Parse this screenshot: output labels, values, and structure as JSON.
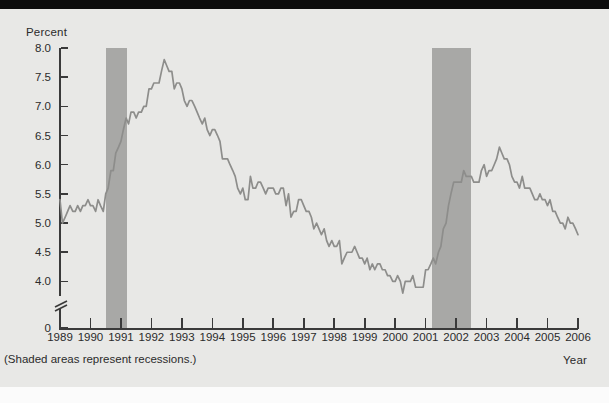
{
  "figure": {
    "background_color": "#e8e8e6",
    "caption": "(Shaded areas represent recessions.)",
    "ylabel": "Percent",
    "xlabel": "Year",
    "line_color": "#8d8d8b",
    "band_color": "#a8a8a6",
    "axis_color": "#3a3a3a"
  },
  "chart_data": {
    "type": "line",
    "title": "",
    "subtitle": "",
    "xlabel": "Year",
    "ylabel": "Percent",
    "annotations": [
      "(Shaded areas represent recessions.)"
    ],
    "grid": false,
    "legend": null,
    "xlim": [
      1989,
      2006
    ],
    "ylim": [
      3.75,
      8.0
    ],
    "y_axis_break": true,
    "y_axis_zero_shown": true,
    "xticks": [
      1989,
      1990,
      1991,
      1992,
      1993,
      1994,
      1995,
      1996,
      1997,
      1998,
      1999,
      2000,
      2001,
      2002,
      2003,
      2004,
      2005,
      2006
    ],
    "xtick_labels": [
      "1989",
      "1990",
      "1991",
      "1992",
      "1993",
      "1994",
      "1995",
      "1996",
      "1997",
      "1998",
      "1999",
      "2000",
      "2001",
      "2002",
      "2003",
      "2004",
      "2005",
      "2006"
    ],
    "yticks": [
      0,
      4.0,
      4.5,
      5.0,
      5.5,
      6.0,
      6.5,
      7.0,
      7.5,
      8.0
    ],
    "ytick_labels": [
      "0",
      "4.0",
      "4.5",
      "5.0",
      "5.5",
      "6.0",
      "6.5",
      "7.0",
      "7.5",
      "8.0"
    ],
    "shaded_regions": [
      {
        "label": "recession",
        "x0": 1990.5,
        "x1": 1991.2
      },
      {
        "label": "recession",
        "x0": 2001.2,
        "x1": 2002.5
      }
    ],
    "series": [
      {
        "name": "Unemployment rate",
        "x": [
          1989.0,
          1989.08,
          1989.17,
          1989.25,
          1989.33,
          1989.42,
          1989.5,
          1989.58,
          1989.67,
          1989.75,
          1989.83,
          1989.92,
          1990.0,
          1990.08,
          1990.17,
          1990.25,
          1990.33,
          1990.42,
          1990.5,
          1990.58,
          1990.67,
          1990.75,
          1990.83,
          1990.92,
          1991.0,
          1991.08,
          1991.17,
          1991.25,
          1991.33,
          1991.42,
          1991.5,
          1991.58,
          1991.67,
          1991.75,
          1991.83,
          1991.92,
          1992.0,
          1992.08,
          1992.17,
          1992.25,
          1992.33,
          1992.42,
          1992.5,
          1992.58,
          1992.67,
          1992.75,
          1992.83,
          1992.92,
          1993.0,
          1993.08,
          1993.17,
          1993.25,
          1993.33,
          1993.42,
          1993.5,
          1993.58,
          1993.67,
          1993.75,
          1993.83,
          1993.92,
          1994.0,
          1994.08,
          1994.17,
          1994.25,
          1994.33,
          1994.42,
          1994.5,
          1994.58,
          1994.67,
          1994.75,
          1994.83,
          1994.92,
          1995.0,
          1995.08,
          1995.17,
          1995.25,
          1995.33,
          1995.42,
          1995.5,
          1995.58,
          1995.67,
          1995.75,
          1995.83,
          1995.92,
          1996.0,
          1996.08,
          1996.17,
          1996.25,
          1996.33,
          1996.42,
          1996.5,
          1996.58,
          1996.67,
          1996.75,
          1996.83,
          1996.92,
          1997.0,
          1997.08,
          1997.17,
          1997.25,
          1997.33,
          1997.42,
          1997.5,
          1997.58,
          1997.67,
          1997.75,
          1997.83,
          1997.92,
          1998.0,
          1998.08,
          1998.17,
          1998.25,
          1998.33,
          1998.42,
          1998.5,
          1998.58,
          1998.67,
          1998.75,
          1998.83,
          1998.92,
          1999.0,
          1999.08,
          1999.17,
          1999.25,
          1999.33,
          1999.42,
          1999.5,
          1999.58,
          1999.67,
          1999.75,
          1999.83,
          1999.92,
          2000.0,
          2000.08,
          2000.17,
          2000.25,
          2000.33,
          2000.42,
          2000.5,
          2000.58,
          2000.67,
          2000.75,
          2000.83,
          2000.92,
          2001.0,
          2001.08,
          2001.17,
          2001.25,
          2001.33,
          2001.42,
          2001.5,
          2001.58,
          2001.67,
          2001.75,
          2001.83,
          2001.92,
          2002.0,
          2002.08,
          2002.17,
          2002.25,
          2002.33,
          2002.42,
          2002.5,
          2002.58,
          2002.67,
          2002.75,
          2002.83,
          2002.92,
          2003.0,
          2003.08,
          2003.17,
          2003.25,
          2003.33,
          2003.42,
          2003.5,
          2003.58,
          2003.67,
          2003.75,
          2003.83,
          2003.92,
          2004.0,
          2004.08,
          2004.17,
          2004.25,
          2004.33,
          2004.42,
          2004.5,
          2004.58,
          2004.67,
          2004.75,
          2004.83,
          2004.92,
          2005.0,
          2005.08,
          2005.17,
          2005.25,
          2005.33,
          2005.42,
          2005.5,
          2005.58,
          2005.67,
          2005.75,
          2005.83,
          2005.92,
          2006.0
        ],
        "values": [
          5.4,
          5.0,
          5.1,
          5.2,
          5.3,
          5.2,
          5.2,
          5.3,
          5.2,
          5.3,
          5.3,
          5.4,
          5.3,
          5.3,
          5.2,
          5.4,
          5.3,
          5.2,
          5.5,
          5.6,
          5.9,
          5.9,
          6.2,
          6.3,
          6.4,
          6.6,
          6.8,
          6.7,
          6.9,
          6.9,
          6.8,
          6.9,
          6.9,
          7.0,
          7.0,
          7.3,
          7.3,
          7.4,
          7.4,
          7.4,
          7.6,
          7.8,
          7.7,
          7.6,
          7.6,
          7.3,
          7.4,
          7.4,
          7.3,
          7.1,
          7.0,
          7.1,
          7.1,
          7.0,
          6.9,
          6.8,
          6.7,
          6.8,
          6.6,
          6.5,
          6.6,
          6.6,
          6.5,
          6.4,
          6.1,
          6.1,
          6.1,
          6.0,
          5.9,
          5.8,
          5.6,
          5.5,
          5.6,
          5.4,
          5.4,
          5.8,
          5.6,
          5.6,
          5.7,
          5.7,
          5.6,
          5.5,
          5.6,
          5.6,
          5.6,
          5.5,
          5.5,
          5.6,
          5.6,
          5.3,
          5.5,
          5.1,
          5.2,
          5.2,
          5.4,
          5.4,
          5.3,
          5.2,
          5.2,
          5.1,
          4.9,
          5.0,
          4.9,
          4.8,
          4.9,
          4.7,
          4.6,
          4.7,
          4.6,
          4.6,
          4.7,
          4.3,
          4.4,
          4.5,
          4.5,
          4.5,
          4.6,
          4.5,
          4.4,
          4.4,
          4.3,
          4.4,
          4.2,
          4.3,
          4.2,
          4.3,
          4.3,
          4.2,
          4.2,
          4.1,
          4.1,
          4.0,
          4.0,
          4.1,
          4.0,
          3.8,
          4.0,
          4.0,
          4.0,
          4.1,
          3.9,
          3.9,
          3.9,
          3.9,
          4.2,
          4.2,
          4.3,
          4.4,
          4.3,
          4.5,
          4.6,
          4.9,
          5.0,
          5.3,
          5.5,
          5.7,
          5.7,
          5.7,
          5.7,
          5.9,
          5.8,
          5.8,
          5.8,
          5.7,
          5.7,
          5.7,
          5.9,
          6.0,
          5.8,
          5.9,
          5.9,
          6.0,
          6.1,
          6.3,
          6.2,
          6.1,
          6.1,
          6.0,
          5.8,
          5.7,
          5.7,
          5.6,
          5.8,
          5.6,
          5.6,
          5.6,
          5.5,
          5.4,
          5.4,
          5.5,
          5.4,
          5.4,
          5.3,
          5.4,
          5.2,
          5.2,
          5.1,
          5.0,
          5.0,
          4.9,
          5.1,
          5.0,
          5.0,
          4.9,
          4.8
        ]
      }
    ]
  }
}
